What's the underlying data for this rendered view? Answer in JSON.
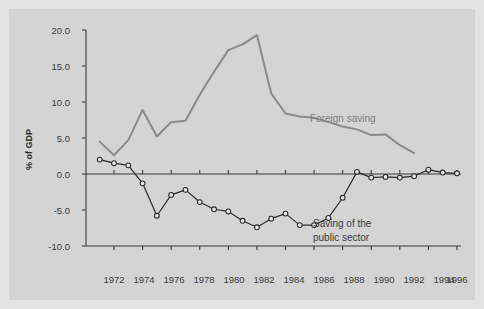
{
  "figure": {
    "background_color": "#d4d4d4",
    "frame_color": "#e3e3e3"
  },
  "axis": {
    "y_label": "% of GDP",
    "y_ticks": [
      "20.0",
      "15.0",
      "10.0",
      "5.0",
      "0.0",
      "-5.0",
      "-10.0"
    ],
    "x_ticks": [
      "1972",
      "1974",
      "1976",
      "1978",
      "1980",
      "1982",
      "1984",
      "1986",
      "1988",
      "1990",
      "1992",
      "1994",
      "1996"
    ]
  },
  "annotations": {
    "foreign_saving": "Foreign saving",
    "public_sector_line1": "Saving of the",
    "public_sector_line2": "public sector"
  },
  "chart_data": {
    "type": "line",
    "title": "",
    "xlabel": "",
    "ylabel": "% of GDP",
    "ylim": [
      -10.0,
      20.0
    ],
    "xlim": [
      1971,
      1996
    ],
    "yticks": [
      20.0,
      15.0,
      10.0,
      5.0,
      0.0,
      -5.0,
      -10.0
    ],
    "xticks": [
      1972,
      1974,
      1976,
      1978,
      1980,
      1982,
      1984,
      1986,
      1988,
      1990,
      1992,
      1994,
      1996
    ],
    "grid": false,
    "legend": "inline-annotations",
    "zero_line": true,
    "x": [
      1971,
      1972,
      1973,
      1974,
      1975,
      1976,
      1977,
      1978,
      1979,
      1980,
      1981,
      1982,
      1983,
      1984,
      1985,
      1986,
      1987,
      1988,
      1989,
      1990,
      1991,
      1992,
      1993
    ],
    "series": [
      {
        "name": "Foreign saving",
        "color": "#8a8a8a",
        "marker": "none",
        "x": [
          1971,
          1972,
          1973,
          1974,
          1975,
          1976,
          1977,
          1978,
          1979,
          1980,
          1981,
          1982,
          1983,
          1984,
          1985,
          1986,
          1987,
          1988,
          1989,
          1990,
          1991,
          1992,
          1993
        ],
        "values": [
          4.5,
          2.6,
          4.7,
          8.9,
          5.2,
          7.2,
          7.4,
          11.0,
          14.2,
          17.2,
          18.0,
          19.3,
          11.2,
          8.4,
          8.0,
          7.8,
          7.2,
          6.6,
          6.2,
          5.4,
          5.5,
          4.0,
          2.9
        ]
      },
      {
        "name": "Saving of the public sector",
        "color": "#2b2b2b",
        "marker": "circle-open",
        "x": [
          1971,
          1972,
          1973,
          1974,
          1975,
          1976,
          1977,
          1978,
          1979,
          1980,
          1981,
          1982,
          1983,
          1984,
          1985,
          1986,
          1987,
          1988,
          1989,
          1990,
          1991,
          1992,
          1993,
          1994,
          1995,
          1996
        ],
        "values": [
          2.0,
          1.5,
          1.2,
          -1.3,
          -5.8,
          -2.9,
          -2.2,
          -3.9,
          -4.9,
          -5.2,
          -6.5,
          -7.4,
          -6.2,
          -5.5,
          -7.1,
          -7.1,
          -6.1,
          -3.3,
          0.3,
          -0.5,
          -0.4,
          -0.5,
          -0.3,
          0.6,
          0.2,
          0.1
        ]
      }
    ]
  }
}
